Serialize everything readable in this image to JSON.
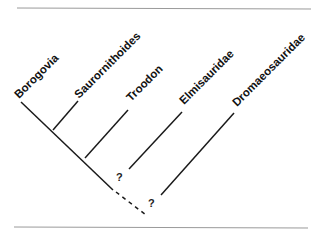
{
  "diagram": {
    "type": "cladogram",
    "taxa": [
      {
        "label": "Borogovia"
      },
      {
        "label": "Saurornithoides"
      },
      {
        "label": "Troodon"
      },
      {
        "label": "Elmisauridae"
      },
      {
        "label": "Dromaeosauridae"
      }
    ],
    "uncertain_nodes": [
      {
        "label": "?"
      },
      {
        "label": "?"
      }
    ]
  },
  "colors": {
    "line": "#1a1a1a",
    "rule": "#9a9a9a",
    "background": "#ffffff"
  }
}
